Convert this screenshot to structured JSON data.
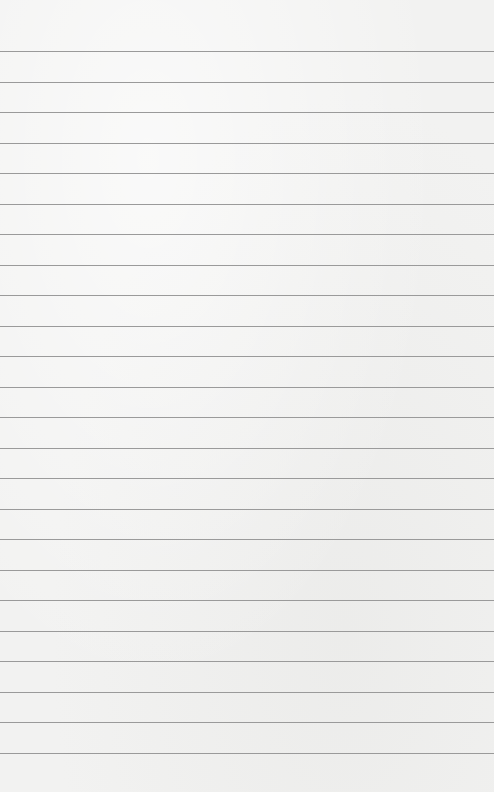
{
  "paper": {
    "background_color": "#f2f2f1",
    "line_color": "#9a9a9a",
    "first_line_y": 51,
    "line_spacing": 30.5,
    "line_count": 24
  }
}
